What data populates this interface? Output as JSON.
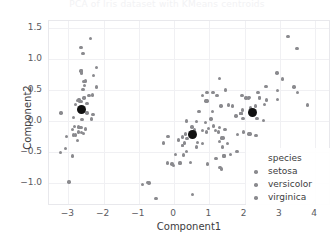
{
  "figure": {
    "cropped_title": "PCA of Iris dataset with KMeans centroids"
  },
  "axes": {
    "xlabel": "Component1",
    "ylabel": "Component2",
    "xticks": [
      "-3",
      "-2",
      "-1",
      "0",
      "1",
      "2",
      "3",
      "4"
    ],
    "yticks": [
      "1.5",
      "1.0",
      "0.5",
      "0.0",
      "-0.5",
      "-1.0"
    ]
  },
  "legend": {
    "title": "species",
    "items": [
      {
        "label": "setosa",
        "color": "#8a8a8e"
      },
      {
        "label": "versicolor",
        "color": "#8a8a8e"
      },
      {
        "label": "virginica",
        "color": "#8a8a8e"
      }
    ]
  },
  "chart_data": {
    "type": "scatter",
    "title": "",
    "xlabel": "Component1",
    "ylabel": "Component2",
    "xlim": [
      -3.55,
      4.45
    ],
    "ylim": [
      -1.38,
      1.62
    ],
    "grid": true,
    "legend_position": "lower right",
    "point_color": "#8a8a8e",
    "centroid_color": "#111111",
    "xticks": [
      -3,
      -2,
      -1,
      0,
      1,
      2,
      3,
      4
    ],
    "yticks": [
      1.5,
      1.0,
      0.5,
      0.0,
      -0.5,
      -1.0
    ],
    "series": [
      {
        "name": "setosa",
        "color": "#8a8a8e",
        "points": [
          [
            -2.68,
            0.32
          ],
          [
            -2.71,
            -0.18
          ],
          [
            -2.89,
            -0.14
          ],
          [
            -2.75,
            -0.32
          ],
          [
            -2.73,
            0.33
          ],
          [
            -2.28,
            0.74
          ],
          [
            -2.82,
            -0.09
          ],
          [
            -2.63,
            0.16
          ],
          [
            -2.89,
            -0.57
          ],
          [
            -2.67,
            -0.11
          ],
          [
            -2.51,
            0.65
          ],
          [
            -2.61,
            0.02
          ],
          [
            -2.79,
            -0.23
          ],
          [
            -3.22,
            -0.51
          ],
          [
            -2.64,
            1.19
          ],
          [
            -2.38,
            1.34
          ],
          [
            -2.62,
            0.81
          ],
          [
            -2.65,
            0.31
          ],
          [
            -2.2,
            0.87
          ],
          [
            -2.59,
            0.51
          ],
          [
            -2.31,
            0.42
          ],
          [
            -2.54,
            0.38
          ],
          [
            -3.21,
            0.13
          ],
          [
            -2.3,
            0.1
          ],
          [
            -2.35,
            0.03
          ],
          [
            -2.51,
            -0.13
          ],
          [
            -2.47,
            0.13
          ],
          [
            -2.56,
            0.37
          ],
          [
            -2.63,
            0.31
          ],
          [
            -2.63,
            -0.19
          ],
          [
            -2.58,
            -0.2
          ],
          [
            -2.41,
            0.41
          ],
          [
            -2.64,
            0.81
          ],
          [
            -2.59,
            1.09
          ],
          [
            -2.63,
            -0.11
          ],
          [
            -2.86,
            0.06
          ],
          [
            -2.62,
            0.78
          ],
          [
            -2.79,
            0.27
          ],
          [
            -3.08,
            -0.45
          ],
          [
            -2.59,
            0.19
          ],
          [
            -2.7,
            0.35
          ],
          [
            -2.98,
            -0.99
          ],
          [
            -3.05,
            -0.25
          ],
          [
            -2.47,
            0.28
          ],
          [
            -2.2,
            0.55
          ],
          [
            -2.71,
            -0.1
          ],
          [
            -2.56,
            0.64
          ],
          [
            -2.86,
            -0.23
          ],
          [
            -2.55,
            0.57
          ],
          [
            -2.64,
            0.17
          ]
        ],
        "centroid": [
          -2.64,
          0.19
        ]
      },
      {
        "name": "versicolor",
        "color": "#8a8a8e",
        "points": [
          [
            1.28,
            0.69
          ],
          [
            0.93,
            0.32
          ],
          [
            1.46,
            0.5
          ],
          [
            0.18,
            -0.68
          ],
          [
            1.09,
            0.15
          ],
          [
            0.64,
            -0.42
          ],
          [
            1.1,
            0.46
          ],
          [
            -0.75,
            -1.0
          ],
          [
            1.04,
            0.03
          ],
          [
            -0.01,
            -0.72
          ],
          [
            -0.51,
            -1.26
          ],
          [
            0.51,
            -0.1
          ],
          [
            0.26,
            -0.55
          ],
          [
            0.98,
            -0.12
          ],
          [
            -0.17,
            -0.25
          ],
          [
            0.93,
            0.46
          ],
          [
            0.66,
            -0.35
          ],
          [
            0.23,
            -0.4
          ],
          [
            0.94,
            -0.7
          ],
          [
            0.04,
            -0.54
          ],
          [
            1.11,
            -0.08
          ],
          [
            0.35,
            -0.0
          ],
          [
            1.29,
            -0.33
          ],
          [
            0.92,
            -0.18
          ],
          [
            0.71,
            0.15
          ],
          [
            0.9,
            0.32
          ],
          [
            1.33,
            0.24
          ],
          [
            1.55,
            0.26
          ],
          [
            0.81,
            -0.16
          ],
          [
            -0.3,
            -0.36
          ],
          [
            -0.06,
            -0.7
          ],
          [
            -0.19,
            -0.68
          ],
          [
            0.13,
            -0.31
          ],
          [
            1.38,
            -0.42
          ],
          [
            0.58,
            -0.15
          ],
          [
            0.8,
            0.41
          ],
          [
            1.22,
            0.41
          ],
          [
            0.81,
            -0.37
          ],
          [
            0.24,
            -0.26
          ],
          [
            0.16,
            -0.68
          ],
          [
            0.46,
            -0.67
          ],
          [
            0.89,
            -0.03
          ],
          [
            0.23,
            -0.4
          ],
          [
            -0.71,
            -1.01
          ],
          [
            0.35,
            -0.5
          ],
          [
            0.33,
            -0.21
          ],
          [
            0.37,
            -0.29
          ],
          [
            0.64,
            -0.01
          ],
          [
            -0.9,
            -1.03
          ],
          [
            0.3,
            -0.36
          ]
        ],
        "centroid": [
          0.53,
          -0.22
        ]
      },
      {
        "name": "virginica",
        "color": "#8a8a8e",
        "points": [
          [
            2.53,
            0.01
          ],
          [
            1.41,
            -0.57
          ],
          [
            2.62,
            0.34
          ],
          [
            1.97,
            -0.18
          ],
          [
            2.35,
            0.04
          ],
          [
            3.4,
            0.55
          ],
          [
            0.52,
            -1.19
          ],
          [
            2.93,
            0.35
          ],
          [
            2.32,
            -0.24
          ],
          [
            2.92,
            0.78
          ],
          [
            1.66,
            0.24
          ],
          [
            1.8,
            -0.22
          ],
          [
            2.17,
            0.21
          ],
          [
            1.34,
            -0.78
          ],
          [
            1.59,
            -0.54
          ],
          [
            1.9,
            0.12
          ],
          [
            1.95,
            0.04
          ],
          [
            3.49,
            1.17
          ],
          [
            3.79,
            0.26
          ],
          [
            1.3,
            -0.76
          ],
          [
            2.42,
            0.38
          ],
          [
            1.19,
            -0.61
          ],
          [
            3.5,
            0.46
          ],
          [
            1.34,
            -0.28
          ],
          [
            2.04,
            0.37
          ],
          [
            2.61,
            0.56
          ],
          [
            1.25,
            -0.18
          ],
          [
            1.28,
            -0.11
          ],
          [
            2.12,
            -0.21
          ],
          [
            2.38,
            0.46
          ],
          [
            2.94,
            0.49
          ],
          [
            3.23,
            1.37
          ],
          [
            2.15,
            -0.21
          ],
          [
            1.44,
            -0.14
          ],
          [
            1.78,
            -0.5
          ],
          [
            3.07,
            0.68
          ],
          [
            2.14,
            0.38
          ],
          [
            1.9,
            0.12
          ],
          [
            1.17,
            -0.16
          ],
          [
            2.11,
            0.37
          ],
          [
            2.31,
            0.24
          ],
          [
            1.92,
            0.41
          ],
          [
            1.41,
            -0.57
          ],
          [
            2.56,
            0.27
          ],
          [
            2.42,
            0.37
          ],
          [
            1.94,
            0.18
          ],
          [
            1.52,
            -0.37
          ],
          [
            1.76,
            0.08
          ],
          [
            1.9,
            0.12
          ],
          [
            1.39,
            -0.28
          ]
        ],
        "centroid": [
          2.22,
          0.13
        ]
      }
    ]
  }
}
